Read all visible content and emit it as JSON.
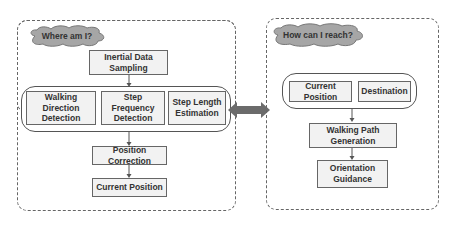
{
  "left_panel": {
    "question": "Where am I?",
    "boxes": {
      "inertial": "Inertial Data Sampling",
      "walking_direction": "Walking Direction Detection",
      "step_frequency": "Step Frequency Detection",
      "step_length": "Step Length Estimation",
      "position_correction": "Position Correction",
      "current_position": "Current Position"
    }
  },
  "right_panel": {
    "question": "How can I reach?",
    "boxes": {
      "current_position": "Current Position",
      "destination": "Destination",
      "walking_path": "Walking Path Generation",
      "orientation": "Orientation Guidance"
    }
  },
  "colors": {
    "box_fill": "#f2f2f2",
    "cloud_fill": "#a6a6a6",
    "double_arrow": "#6b6b6b",
    "border": "#666666"
  }
}
